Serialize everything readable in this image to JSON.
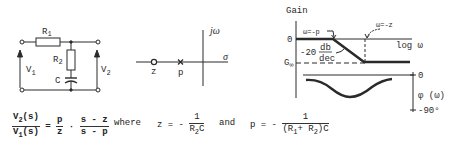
{
  "circuit": {
    "r1_label": "R",
    "r1_sub": "1",
    "r2_label": "R",
    "r2_sub": "2",
    "c_label": "C",
    "v1_label": "V",
    "v1_sub": "1",
    "v2_label": "V",
    "v2_sub": "2"
  },
  "pole_zero_plot": {
    "imag_axis_label": "jω",
    "real_axis_label": "σ",
    "zero_label": "z",
    "pole_label": "p"
  },
  "bode_plot": {
    "gain_label": "Gain",
    "zero_tick": "0",
    "pole_annotation": "ω=-p",
    "zero_annotation": "ω=-z",
    "x_axis_label": "log ω",
    "slope_value": "-20",
    "slope_num": "db",
    "slope_den": "dec",
    "g_inf_label": "G",
    "g_inf_sub": "∞",
    "phase_zero_tick": "0",
    "phase_label": "φ (ω)",
    "phase_min_tick": "-90°"
  },
  "equations": {
    "lhs_num": "V",
    "lhs_num_sub": "2",
    "lhs_num_arg": "(s)",
    "lhs_den": "V",
    "lhs_den_sub": "1",
    "lhs_den_arg": "(s)",
    "equals": "=",
    "rhs_frac1_num": "p",
    "rhs_frac1_den": "z",
    "dot": "·",
    "rhs_frac2_num": "s - z",
    "rhs_frac2_den": "s - p",
    "where": "where",
    "z_def_lhs": "z = -",
    "z_def_num": "1",
    "z_def_den_r": "R",
    "z_def_den_sub": "2",
    "z_def_den_c": "C",
    "and": "and",
    "p_def_lhs": "p = -",
    "p_def_num": "1",
    "p_def_den": "(R",
    "p_def_den_sub1": "1",
    "p_def_den_plus": "+ R",
    "p_def_den_sub2": "2",
    "p_def_den_end": ")C"
  }
}
